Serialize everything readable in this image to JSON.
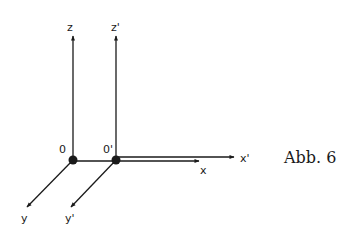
{
  "figure": {
    "caption": "Abb. 6",
    "ink_color": "#1a1a1a",
    "background": "#ffffff"
  },
  "systems": [
    {
      "name": "unprimed",
      "origin_label": "0",
      "axes": {
        "x": "x",
        "y": "y",
        "z": "z"
      }
    },
    {
      "name": "primed",
      "origin_label": "0'",
      "axes": {
        "x": "x'",
        "y": "y'",
        "z": "z'"
      }
    }
  ]
}
